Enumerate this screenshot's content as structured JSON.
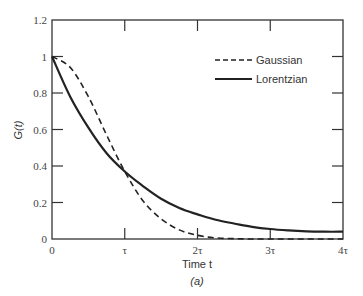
{
  "chart_data": {
    "type": "line",
    "title": "",
    "caption": "(a)",
    "xlabel": "Time t",
    "ylabel": "G(t)",
    "xlim": [
      0,
      4
    ],
    "ylim": [
      0,
      1.2
    ],
    "x_tick_labels": [
      "0",
      "τ",
      "2τ",
      "3τ",
      "4τ"
    ],
    "x_ticks": [
      0,
      1,
      2,
      3,
      4
    ],
    "y_tick_labels": [
      "0",
      "0.2",
      "0.4",
      "0.6",
      "0.8",
      "1",
      "1.2"
    ],
    "y_ticks": [
      0,
      0.2,
      0.4,
      0.6,
      0.8,
      1.0,
      1.2
    ],
    "grid": false,
    "legend_position": "upper right",
    "x": [
      0,
      0.25,
      0.5,
      0.75,
      1.0,
      1.25,
      1.5,
      1.75,
      2.0,
      2.25,
      2.5,
      2.75,
      3.0,
      3.25,
      3.5,
      3.75,
      4.0
    ],
    "series": [
      {
        "name": "Gaussian",
        "style": "dashed",
        "values": [
          1.0,
          0.94,
          0.78,
          0.57,
          0.37,
          0.21,
          0.11,
          0.05,
          0.02,
          0.006,
          0.002,
          0.0,
          0.0,
          0.0,
          0.0,
          0.0,
          0.0
        ]
      },
      {
        "name": "Lorentzian",
        "style": "solid",
        "values": [
          1.0,
          0.78,
          0.61,
          0.47,
          0.37,
          0.29,
          0.22,
          0.17,
          0.135,
          0.105,
          0.085,
          0.067,
          0.055,
          0.047,
          0.042,
          0.04,
          0.04
        ]
      }
    ]
  },
  "legend": {
    "items": [
      {
        "label": "Gaussian"
      },
      {
        "label": "Lorentzian"
      }
    ]
  },
  "axes": {
    "xlabel": "Time t",
    "ylabel": "G(t)",
    "caption": "(a)"
  }
}
